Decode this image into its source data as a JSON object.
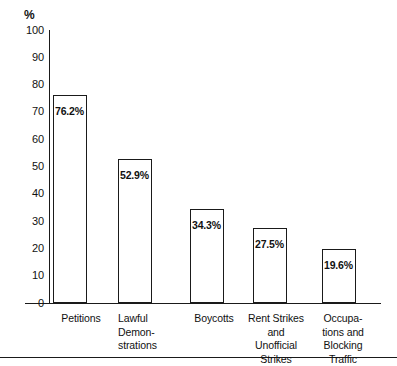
{
  "chart_data": {
    "type": "bar",
    "title": "",
    "subtitle": "",
    "xlabel": "",
    "ylabel": "%",
    "ylim": [
      0,
      100
    ],
    "grid": false,
    "legend": "none",
    "categories": [
      "Petitions",
      "Lawful\nDemon-\nstrations",
      "Boycotts",
      "Rent Strikes\nand\nUnofficial\nStrikes",
      "Occupa-\ntions and\nBlocking\nTraffic"
    ],
    "values": [
      76.2,
      52.9,
      34.3,
      27.5,
      19.6
    ],
    "value_labels": [
      "76.2%",
      "52.9%",
      "34.3%",
      "27.5%",
      "19.6%"
    ],
    "yticks": [
      0,
      10,
      20,
      30,
      40,
      50,
      60,
      70,
      80,
      90,
      100
    ],
    "ytick_labels": [
      "0",
      "10",
      "20",
      "30",
      "40",
      "50",
      "60",
      "70",
      "80",
      "90",
      "100"
    ],
    "bar_fill_color": "#ffffff",
    "bar_edge_color": "#1a1a1a",
    "axis_color": "#1a1a1a",
    "text_color": "#111111"
  },
  "axis": {
    "percent_symbol": "%"
  }
}
